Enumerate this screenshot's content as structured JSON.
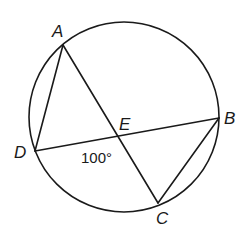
{
  "figure": {
    "type": "circle-geometry",
    "circle": {
      "cx": 124,
      "cy": 117,
      "r": 95
    },
    "points": {
      "A": {
        "label": "A",
        "x": 63,
        "y": 45
      },
      "B": {
        "label": "B",
        "x": 219,
        "y": 118
      },
      "C": {
        "label": "C",
        "x": 158,
        "y": 203
      },
      "D": {
        "label": "D",
        "x": 35,
        "y": 151
      },
      "E": {
        "label": "E",
        "x": 117,
        "y": 137
      }
    },
    "segments": [
      "AD",
      "AC",
      "DB",
      "BC"
    ],
    "angle_annotation": {
      "text": "100°",
      "at_vertex": "E",
      "angle": "DEC"
    }
  }
}
